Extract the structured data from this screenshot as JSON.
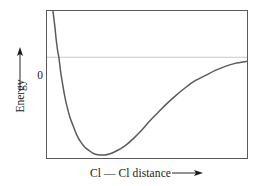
{
  "figure": {
    "title": "",
    "y_axis": {
      "label": "Energy",
      "zero_tick_label": "0",
      "arrow_icon": "arrow-up-icon"
    },
    "x_axis": {
      "label": "Cl — Cl distance",
      "arrow_icon": "arrow-right-icon"
    },
    "colors": {
      "curve": "#5a5a5a",
      "frame": "#5a5a5a",
      "zero_line": "#c9c9c9",
      "text": "#1a1a1a",
      "background": "#ffffff"
    }
  },
  "chart_data": {
    "type": "line",
    "xlabel": "Cl — Cl distance",
    "ylabel": "Energy",
    "grid": false,
    "legend": null,
    "xlim": [
      0,
      202
    ],
    "ylim": [
      -100,
      46
    ],
    "axis_tick_labels": {
      "y": [
        "0"
      ],
      "x": []
    },
    "annotations": [
      "Zero-energy reference line shown as light horizontal line",
      "Curve rises steeply at short distance (repulsion)",
      "Curve has an energy minimum at the equilibrium bond length",
      "Curve approaches zero asymptotically at large distance"
    ],
    "series": [
      {
        "name": "Cl—Cl potential energy",
        "x": [
          6,
          8,
          9,
          10,
          11,
          12,
          13,
          14,
          16,
          18,
          20,
          23,
          26,
          30,
          34,
          38,
          43,
          48,
          53,
          58,
          63,
          68,
          74,
          80,
          88,
          96,
          104,
          112,
          120,
          130,
          140,
          150,
          160,
          170,
          180,
          190,
          202
        ],
        "y": [
          46,
          30,
          20,
          12,
          5,
          0,
          -8,
          -16,
          -28,
          -39,
          -48,
          -59,
          -67,
          -77,
          -84,
          -89,
          -93,
          -96,
          -97,
          -97,
          -96,
          -94,
          -91,
          -87,
          -80,
          -72,
          -63,
          -55,
          -47,
          -38,
          -30,
          -23,
          -18,
          -13,
          -9,
          -6,
          -4
        ]
      }
    ]
  }
}
